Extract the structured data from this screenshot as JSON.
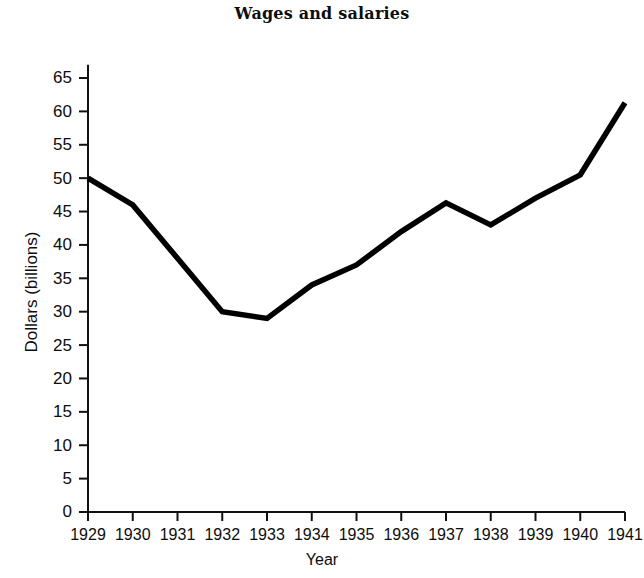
{
  "chart_data": {
    "type": "line",
    "title": "Wages and salaries",
    "xlabel": "Year",
    "ylabel": "Dollars (billions)",
    "categories": [
      "1929",
      "1930",
      "1931",
      "1932",
      "1933",
      "1934",
      "1935",
      "1936",
      "1937",
      "1938",
      "1939",
      "1940",
      "1941"
    ],
    "x": [
      1929,
      1930,
      1931,
      1932,
      1933,
      1934,
      1935,
      1936,
      1937,
      1938,
      1939,
      1940,
      1941
    ],
    "values": [
      50.0,
      46.0,
      38.0,
      30.0,
      29.0,
      34.0,
      37.0,
      42.0,
      46.3,
      43.0,
      47.0,
      50.5,
      61.3
    ],
    "series": [
      {
        "name": "Wages and salaries",
        "values": [
          50.0,
          46.0,
          38.0,
          30.0,
          29.0,
          34.0,
          37.0,
          42.0,
          46.3,
          43.0,
          47.0,
          50.5,
          61.3
        ],
        "color": "#000000"
      }
    ],
    "ylim": [
      0,
      67
    ],
    "xlim": [
      1929,
      1941
    ],
    "y_ticks": [
      0,
      5,
      10,
      15,
      20,
      25,
      30,
      35,
      40,
      45,
      50,
      55,
      60,
      65
    ],
    "y_tick_labels": [
      "0",
      "5",
      "10",
      "15",
      "20",
      "25",
      "30",
      "35",
      "40",
      "45",
      "50",
      "55",
      "60",
      "65"
    ],
    "x_tick_labels": [
      "1929",
      "1930",
      "1931",
      "1932",
      "1933",
      "1934",
      "1935",
      "1936",
      "1937",
      "1938",
      "1939",
      "1940",
      "1941"
    ],
    "grid": false,
    "legend": false,
    "legend_position": "none",
    "line_color": "#000000",
    "background_color": "#ffffff",
    "axis_color": "#111111"
  }
}
